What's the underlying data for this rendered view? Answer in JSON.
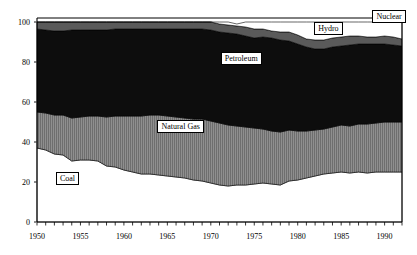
{
  "chart_data": {
    "type": "area",
    "stacked": true,
    "title": "",
    "subtitle": "",
    "xlabel": "",
    "ylabel": "",
    "xlim": [
      1950,
      1992
    ],
    "ylim": [
      0,
      100
    ],
    "grid": false,
    "legend_position": "inline-annotations",
    "x_tick_labels": [
      "1950",
      "1955",
      "1960",
      "1965",
      "1970",
      "1975",
      "1980",
      "1985",
      "1990"
    ],
    "x_tick_values": [
      1950,
      1955,
      1960,
      1965,
      1970,
      1975,
      1980,
      1985,
      1990
    ],
    "x_minor_tick_step": 1,
    "y_tick_labels": [
      "0",
      "20",
      "40",
      "60",
      "80",
      "100"
    ],
    "y_tick_values": [
      0,
      20,
      40,
      60,
      80,
      100
    ],
    "x": [
      1950,
      1951,
      1952,
      1953,
      1954,
      1955,
      1956,
      1957,
      1958,
      1959,
      1960,
      1961,
      1962,
      1963,
      1964,
      1965,
      1966,
      1967,
      1968,
      1969,
      1970,
      1971,
      1972,
      1973,
      1974,
      1975,
      1976,
      1977,
      1978,
      1979,
      1980,
      1981,
      1982,
      1983,
      1984,
      1985,
      1986,
      1987,
      1988,
      1989,
      1990,
      1991,
      1992
    ],
    "series": [
      {
        "name": "Coal",
        "color": "#ffffff",
        "pattern": "solid-white",
        "values": [
          37.0,
          36.0,
          34.0,
          33.5,
          30.5,
          31.0,
          31.0,
          30.5,
          28.0,
          27.5,
          26.0,
          25.0,
          24.0,
          24.0,
          23.5,
          23.0,
          22.5,
          22.0,
          21.0,
          20.5,
          19.5,
          18.5,
          18.0,
          18.5,
          18.5,
          19.0,
          19.5,
          19.0,
          18.5,
          20.5,
          21.0,
          22.0,
          23.0,
          24.0,
          24.5,
          25.0,
          24.5,
          25.0,
          24.5,
          25.0,
          25.0,
          25.0,
          25.0
        ]
      },
      {
        "name": "Natural Gas",
        "color": "#8a8a8a",
        "pattern": "vertical-hatch",
        "values": [
          18.0,
          18.5,
          19.5,
          20.0,
          21.5,
          21.5,
          22.0,
          22.5,
          24.5,
          25.5,
          27.0,
          28.0,
          29.0,
          29.5,
          30.0,
          30.0,
          30.0,
          30.0,
          30.5,
          31.0,
          31.0,
          31.0,
          30.5,
          29.5,
          29.0,
          28.0,
          27.0,
          26.5,
          26.5,
          25.5,
          24.5,
          23.5,
          23.0,
          22.5,
          23.0,
          23.5,
          23.5,
          24.0,
          24.5,
          24.5,
          25.0,
          25.0,
          25.0
        ]
      },
      {
        "name": "Petroleum",
        "color": "#0d0d0d",
        "pattern": "solid-black",
        "values": [
          41.5,
          41.5,
          42.0,
          42.0,
          44.0,
          43.5,
          43.0,
          43.0,
          43.5,
          43.5,
          43.5,
          43.5,
          43.5,
          43.0,
          43.0,
          43.5,
          44.0,
          44.5,
          45.0,
          45.0,
          45.5,
          45.5,
          46.0,
          46.0,
          45.5,
          45.0,
          46.0,
          46.5,
          46.0,
          44.5,
          43.5,
          42.0,
          40.5,
          40.0,
          40.0,
          39.5,
          40.5,
          40.0,
          40.0,
          39.5,
          39.0,
          38.5,
          38.0
        ]
      },
      {
        "name": "Hydro",
        "color": "#5a5a5a",
        "pattern": "gray-band",
        "values": [
          3.5,
          4.0,
          4.5,
          4.5,
          4.0,
          4.0,
          4.0,
          4.0,
          4.0,
          3.5,
          3.5,
          3.5,
          3.5,
          3.5,
          3.5,
          3.5,
          3.5,
          3.5,
          3.5,
          3.5,
          4.0,
          4.0,
          4.0,
          4.0,
          4.5,
          4.5,
          4.0,
          3.5,
          4.0,
          4.5,
          4.5,
          4.0,
          4.5,
          4.5,
          4.5,
          4.5,
          4.5,
          4.0,
          3.5,
          3.5,
          4.0,
          4.0,
          3.5
        ]
      },
      {
        "name": "Nuclear",
        "color": "#ffffff",
        "pattern": "solid-white",
        "values": [
          0.0,
          0.0,
          0.0,
          0.0,
          0.0,
          0.0,
          0.0,
          0.0,
          0.0,
          0.0,
          0.0,
          0.0,
          0.0,
          0.0,
          0.0,
          0.0,
          0.0,
          0.0,
          0.0,
          0.0,
          0.0,
          1.0,
          1.5,
          1.0,
          2.5,
          3.5,
          3.5,
          4.5,
          5.0,
          5.0,
          6.5,
          8.5,
          9.0,
          9.0,
          8.0,
          7.5,
          7.0,
          7.0,
          7.5,
          7.5,
          7.0,
          7.5,
          8.5
        ]
      }
    ],
    "annotations": [
      {
        "label": "Coal",
        "x": 1953.5,
        "y": 22
      },
      {
        "label": "Natural Gas",
        "x": 1966.5,
        "y": 48
      },
      {
        "label": "Petroleum",
        "x": 1973.5,
        "y": 82
      },
      {
        "label": "Hydro",
        "x": 1983.5,
        "y": 97
      },
      {
        "label": "Nuclear",
        "x": 1990.5,
        "y": 103
      }
    ]
  }
}
